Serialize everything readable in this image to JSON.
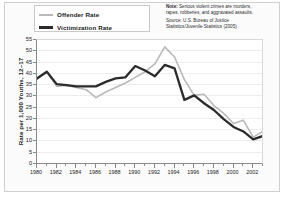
{
  "legend": {
    "items": [
      {
        "label": "Offender Rate",
        "color": "#b9b9b9",
        "swatch_name": "legend-swatch-offender"
      },
      {
        "label": "Victimization Rate",
        "color": "#2b2b2b",
        "swatch_name": "legend-swatch-victimization"
      }
    ]
  },
  "note": {
    "lines": [
      "Note: Serious violent crimes are murders,",
      "rapes, robberies, and aggravated assaults.",
      "Source: U.S. Bureau of Justice",
      "Statistics/Juvenile Statistics (2005)"
    ],
    "bold_prefix": "Note:"
  },
  "chart_data": {
    "type": "line",
    "title": "",
    "xlabel": "",
    "ylabel": "Rate per 1,000 Youths, 12–17",
    "xlim": [
      1980,
      2003
    ],
    "ylim": [
      0,
      55
    ],
    "grid": true,
    "legend_position": "top-left",
    "yticks": [
      0,
      5,
      10,
      15,
      20,
      25,
      30,
      35,
      40,
      45,
      50,
      55
    ],
    "ytick_labels": [
      "0",
      "5",
      "10",
      "15",
      "20",
      "25",
      "30",
      "35",
      "40",
      "45",
      "50",
      "55"
    ],
    "xticks": [
      1980,
      1982,
      1984,
      1986,
      1988,
      1990,
      1992,
      1994,
      1996,
      1998,
      2000,
      2002
    ],
    "xtick_labels": [
      "1980",
      "1982",
      "1984",
      "1986",
      "1988",
      "1990",
      "1992",
      "1994",
      "1996",
      "1998",
      "2000",
      "2002"
    ],
    "x": [
      1980,
      1981,
      1982,
      1983,
      1984,
      1985,
      1986,
      1987,
      1988,
      1989,
      1990,
      1991,
      1992,
      1993,
      1994,
      1995,
      1996,
      1997,
      1998,
      1999,
      2000,
      2001,
      2002,
      2003
    ],
    "series": [
      {
        "name": "Offender Rate",
        "color": "#b9b9b9",
        "width": 1.6,
        "values": [
          37.5,
          40.5,
          34.0,
          34.5,
          33.5,
          32.5,
          29.0,
          31.5,
          33.5,
          35.5,
          38.0,
          40.5,
          44.0,
          51.5,
          47.0,
          37.0,
          30.0,
          30.5,
          25.5,
          22.0,
          17.5,
          19.0,
          11.5,
          14.0
        ]
      },
      {
        "name": "Victimization Rate",
        "color": "#2b2b2b",
        "width": 2.3,
        "values": [
          37.5,
          40.5,
          35.0,
          34.5,
          34.0,
          34.0,
          34.0,
          36.0,
          37.5,
          38.0,
          43.0,
          41.0,
          38.5,
          43.5,
          42.0,
          28.0,
          30.0,
          26.5,
          23.5,
          19.5,
          16.0,
          14.0,
          10.5,
          12.0
        ]
      }
    ]
  }
}
